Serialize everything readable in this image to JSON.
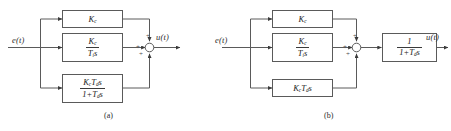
{
  "figure": {
    "background_color": "#ffffff",
    "line_color": "#5a5a5a",
    "text_color": "#2b2b2b",
    "type": "control-block-diagram"
  },
  "diagram_a": {
    "caption": "(a)",
    "input_label": "e(t)",
    "output_label": "u(t)",
    "blocks": [
      {
        "name": "proportional-block",
        "kind": "plain",
        "text": "K_c",
        "numerator": "K_c",
        "denominator": ""
      },
      {
        "name": "integral-block",
        "kind": "fraction",
        "text": "K_c / (T_i s)",
        "numerator": "K_c",
        "denominator": "T_i s"
      },
      {
        "name": "derivative-block",
        "kind": "fraction",
        "text": "K_c T_d s / (1 + T_d s)",
        "numerator": "K_c T_d s",
        "denominator": "1 + T_d s"
      }
    ],
    "summing_junction": {
      "name": "summing-junction",
      "signs": [
        "+",
        "+",
        "+"
      ]
    }
  },
  "diagram_b": {
    "caption": "(b)",
    "input_label": "e(t)",
    "output_label": "u(t)",
    "blocks": [
      {
        "name": "proportional-block",
        "kind": "plain",
        "text": "K_c",
        "numerator": "K_c",
        "denominator": ""
      },
      {
        "name": "integral-block",
        "kind": "fraction",
        "text": "K_c / (T_i s)",
        "numerator": "K_c",
        "denominator": "T_i s"
      },
      {
        "name": "derivative-block",
        "kind": "plain",
        "text": "K_c T_d s",
        "numerator": "K_c T_d s",
        "denominator": ""
      },
      {
        "name": "filter-block",
        "kind": "fraction",
        "text": "1 / (1 + T_d s)",
        "numerator": "1",
        "denominator": "1 + T_d s"
      }
    ],
    "summing_junction": {
      "name": "summing-junction",
      "signs": [
        "+",
        "+",
        "+"
      ]
    }
  }
}
